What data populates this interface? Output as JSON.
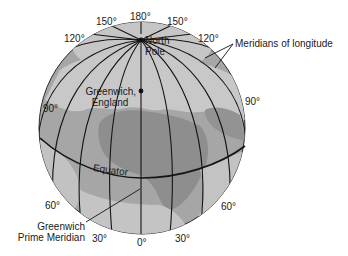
{
  "diagram": {
    "type": "globe-longitude",
    "colors": {
      "ocean": "#a8a8a8",
      "land": "#c9c9c9",
      "land_dark": "#8f8f8f",
      "lines": "#141414",
      "text": "#1a1a1a",
      "background": "#ffffff"
    },
    "labels": {
      "north_pole": [
        "North",
        "Pole"
      ],
      "greenwich_england": [
        "Greenwich,",
        "England"
      ],
      "equator": "Equator",
      "meridians_of_longitude": "Meridians of longitude",
      "prime_meridian": [
        "Greenwich",
        "Prime Meridian"
      ]
    },
    "degree_labels": {
      "top_180": "180°",
      "top_left_150": "150°",
      "top_right_150": "150°",
      "left_120": "120°",
      "right_120": "120°",
      "left_90": "90°",
      "right_90": "90°",
      "left_60": "60°",
      "right_60": "60°",
      "bottom_left_30": "30°",
      "bottom_right_30": "30°",
      "bottom_0": "0°"
    }
  }
}
